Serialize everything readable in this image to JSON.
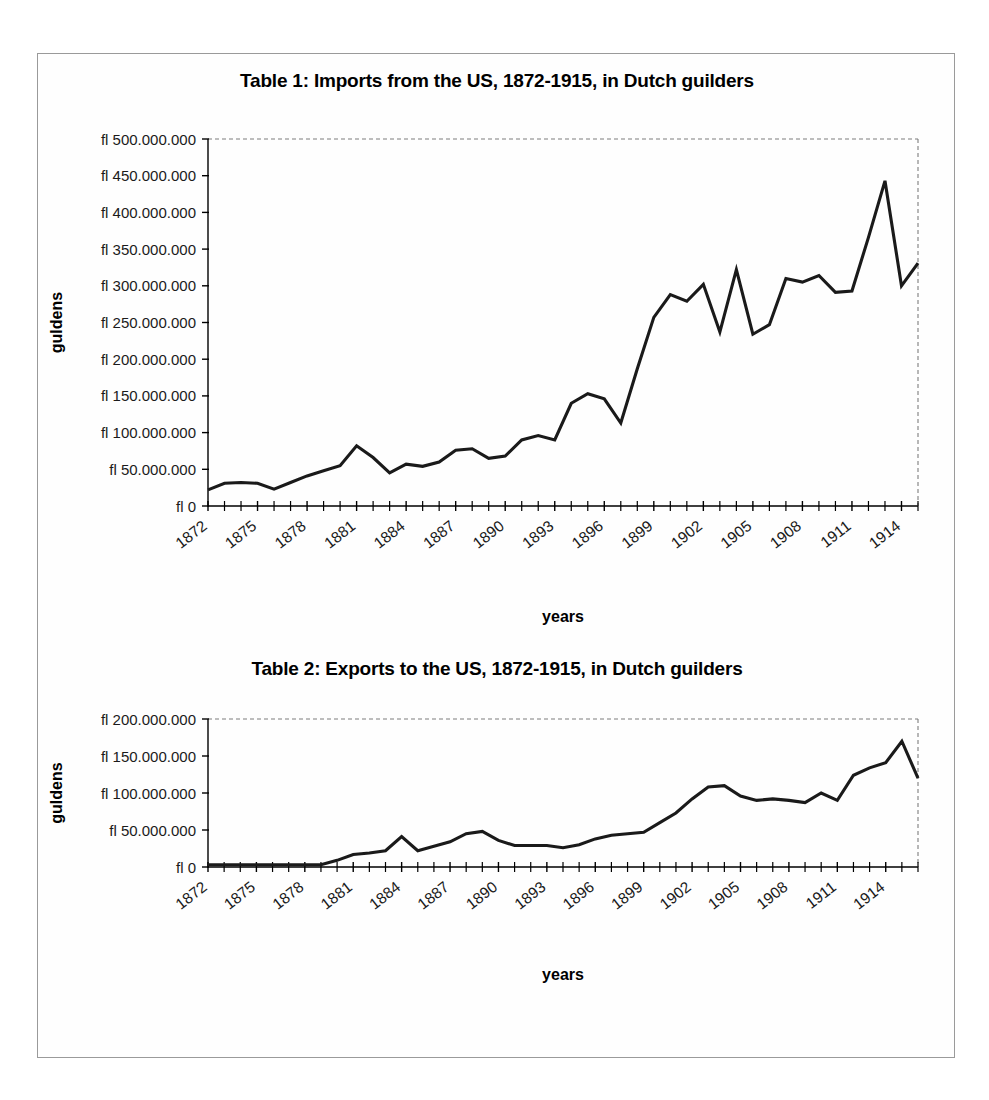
{
  "page": {
    "background_color": "#ffffff",
    "border_color": "#9a9a9a",
    "line_color": "#1a1a1a"
  },
  "charts": [
    {
      "id": "chart1",
      "title": "Table 1: Imports from the US, 1872-1915, in Dutch guilders",
      "xlabel": "years",
      "ylabel": "guldens",
      "ytick_labels": [
        "fl 500.000.000",
        "fl 450.000.000",
        "fl 400.000.000",
        "fl 350.000.000",
        "fl 300.000.000",
        "fl 250.000.000",
        "fl 200.000.000",
        "fl 150.000.000",
        "fl 100.000.000",
        "fl 50.000.000",
        "fl 0"
      ],
      "xtick_labels": [
        "1872",
        "1875",
        "1878",
        "1881",
        "1884",
        "1887",
        "1890",
        "1893",
        "1896",
        "1899",
        "1902",
        "1905",
        "1908",
        "1911",
        "1914"
      ]
    },
    {
      "id": "chart2",
      "title": "Table 2: Exports to the US, 1872-1915, in Dutch guilders",
      "xlabel": "years",
      "ylabel": "guldens",
      "ytick_labels": [
        "fl 200.000.000",
        "fl 150.000.000",
        "fl 100.000.000",
        "fl 50.000.000",
        "fl 0"
      ],
      "xtick_labels": [
        "1872",
        "1875",
        "1878",
        "1881",
        "1884",
        "1887",
        "1890",
        "1893",
        "1896",
        "1899",
        "1902",
        "1905",
        "1908",
        "1911",
        "1914"
      ]
    }
  ],
  "chart_data": [
    {
      "type": "line",
      "title": "Table 1: Imports from the US, 1872-1915, in Dutch guilders",
      "xlabel": "years",
      "ylabel": "guldens",
      "ylim": [
        0,
        500000000
      ],
      "ytick_values": [
        0,
        50000000,
        100000000,
        150000000,
        200000000,
        250000000,
        300000000,
        350000000,
        400000000,
        450000000,
        500000000
      ],
      "grid": false,
      "legend": "none",
      "x": [
        1872,
        1873,
        1874,
        1875,
        1876,
        1877,
        1878,
        1879,
        1880,
        1881,
        1882,
        1883,
        1884,
        1885,
        1886,
        1887,
        1888,
        1889,
        1890,
        1891,
        1892,
        1893,
        1894,
        1895,
        1896,
        1897,
        1898,
        1899,
        1900,
        1901,
        1902,
        1903,
        1904,
        1905,
        1906,
        1907,
        1908,
        1909,
        1910,
        1911,
        1912,
        1913,
        1914,
        1915
      ],
      "values": [
        22000000,
        31000000,
        32000000,
        31000000,
        23000000,
        32000000,
        41000000,
        48000000,
        55000000,
        82000000,
        66000000,
        45000000,
        57000000,
        54000000,
        60000000,
        76000000,
        78000000,
        65000000,
        68000000,
        90000000,
        96000000,
        90000000,
        140000000,
        153000000,
        146000000,
        113000000,
        187000000,
        257000000,
        288000000,
        279000000,
        302000000,
        237000000,
        322000000,
        234000000,
        247000000,
        310000000,
        305000000,
        314000000,
        291000000,
        293000000,
        366000000,
        443000000,
        300000000,
        331000000
      ]
    },
    {
      "type": "line",
      "title": "Table 2: Exports to the US, 1872-1915, in Dutch guilders",
      "xlabel": "years",
      "ylabel": "guldens",
      "ylim": [
        0,
        200000000
      ],
      "ytick_values": [
        0,
        50000000,
        100000000,
        150000000,
        200000000
      ],
      "grid": false,
      "legend": "none",
      "x": [
        1872,
        1873,
        1874,
        1875,
        1876,
        1877,
        1878,
        1879,
        1880,
        1881,
        1882,
        1883,
        1884,
        1885,
        1886,
        1887,
        1888,
        1889,
        1890,
        1891,
        1892,
        1893,
        1894,
        1895,
        1896,
        1897,
        1898,
        1899,
        1900,
        1901,
        1902,
        1903,
        1904,
        1905,
        1906,
        1907,
        1908,
        1909,
        1910,
        1911,
        1912,
        1913,
        1914,
        1915
      ],
      "values": [
        3000000,
        3000000,
        3000000,
        3000000,
        3000000,
        3000000,
        3000000,
        3000000,
        9000000,
        17000000,
        19000000,
        22000000,
        41000000,
        22000000,
        28000000,
        34000000,
        45000000,
        48000000,
        36000000,
        29000000,
        29000000,
        29000000,
        26000000,
        30000000,
        38000000,
        43000000,
        45000000,
        47000000,
        60000000,
        73000000,
        92000000,
        108000000,
        110000000,
        96000000,
        90000000,
        92000000,
        90000000,
        87000000,
        100000000,
        90000000,
        124000000,
        134000000,
        141000000,
        170000000,
        120000000
      ]
    }
  ]
}
